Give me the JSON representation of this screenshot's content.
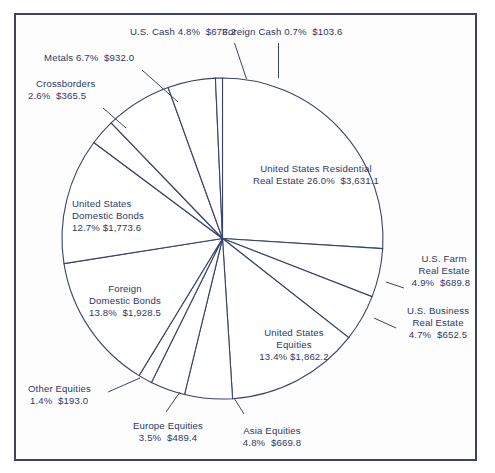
{
  "chart_data": {
    "type": "pie",
    "title": "",
    "subtitle": "",
    "xlabel": "",
    "ylabel": "",
    "legend_position": "none",
    "grid": false,
    "value_prefix": "$",
    "start_angle_deg": 0,
    "direction": "clockwise",
    "categories": [
      "United States Residential Real Estate",
      "U.S. Farm Real Estate",
      "U.S. Business Real Estate",
      "United States Equities",
      "Asia Equities",
      "Europe Equities",
      "Other Equities",
      "Foreign Domestic Bonds",
      "United States Domestic Bonds",
      "Crossborders",
      "Metals",
      "U.S. Cash",
      "Foreign Cash"
    ],
    "percents": [
      26.0,
      4.9,
      4.7,
      13.4,
      4.8,
      3.5,
      1.4,
      13.8,
      12.7,
      2.6,
      6.7,
      4.8,
      0.7
    ],
    "values": [
      3631.1,
      689.8,
      652.5,
      1862.2,
      669.8,
      489.4,
      193.0,
      1928.5,
      1773.6,
      365.5,
      932.0,
      673.2,
      103.6
    ],
    "slice_color": "#ffffff",
    "outline_color": "#39436b",
    "text_color": "#2d3866"
  },
  "labels": {
    "us_cash": "U.S. Cash 4.8%  $673.2",
    "foreign_cash": "Foreign Cash 0.7%  $103.6",
    "metals": "Metals 6.7%  $932.0",
    "crossborders_l1": "Crossborders",
    "crossborders_l2": "2.6%  $365.5",
    "us_residential_l1": "United States Residential",
    "us_residential_l2": "Real Estate 26.0%  $3,631.1",
    "us_domestic_bonds_l1": "United States",
    "us_domestic_bonds_l2": "Domestic Bonds",
    "us_domestic_bonds_l3": "12.7% $1,773.6",
    "foreign_domestic_bonds_l1": "Foreign",
    "foreign_domestic_bonds_l2": "Domestic Bonds",
    "foreign_domestic_bonds_l3": "13.8%  $1,928.5",
    "us_farm_l1": "U.S. Farm",
    "us_farm_l2": "Real Estate",
    "us_farm_l3": "4.9%  $689.8",
    "us_business_l1": "U.S. Business",
    "us_business_l2": "Real Estate",
    "us_business_l3": "4.7%  $652.5",
    "us_equities_l1": "United States",
    "us_equities_l2": "Equities",
    "us_equities_l3": "13.4% $1,862.2",
    "other_equities_l1": "Other Equities",
    "other_equities_l2": "1.4%  $193.0",
    "europe_equities_l1": "Europe Equities",
    "europe_equities_l2": "3.5%  $489.4",
    "asia_equities_l1": "Asia Equities",
    "asia_equities_l2": "4.8%  $669.8"
  }
}
